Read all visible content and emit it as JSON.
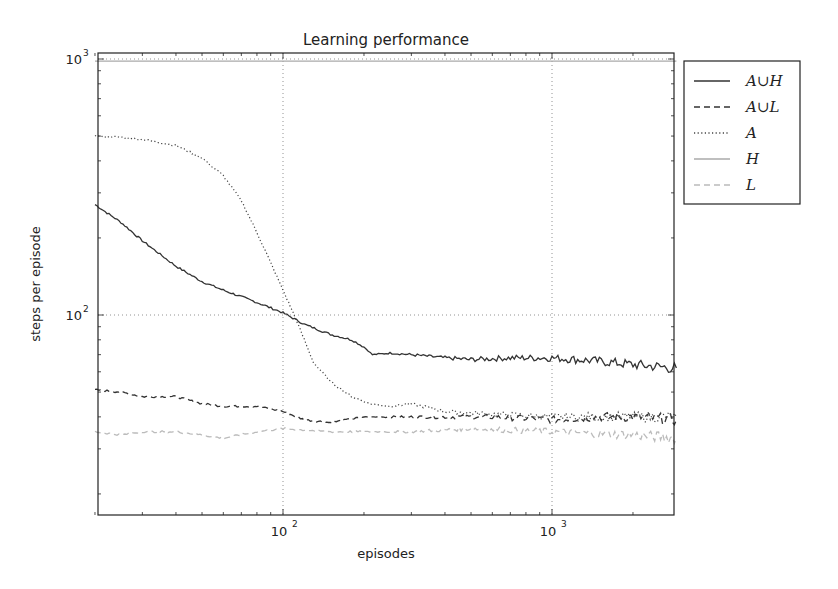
{
  "chart_data": {
    "type": "line",
    "title": "Learning performance",
    "xlabel": "episodes",
    "ylabel": "steps per episode",
    "xscale": "log",
    "yscale": "log",
    "xlim": [
      20,
      2900
    ],
    "ylim": [
      16.5,
      1050
    ],
    "x_ticks": [
      {
        "value": 100,
        "label": "10",
        "exp": "2"
      },
      {
        "value": 1000,
        "label": "10",
        "exp": "3"
      }
    ],
    "y_ticks": [
      {
        "value": 100,
        "label": "10",
        "exp": "2"
      },
      {
        "value": 1000,
        "label": "10",
        "exp": "3"
      }
    ],
    "grid": true,
    "legend_position": "outside upper right",
    "series": [
      {
        "name": "A∪H",
        "style": "solid",
        "color": "#333333",
        "x": [
          20,
          25,
          30,
          40,
          50,
          60,
          80,
          100,
          120,
          150,
          180,
          200,
          215,
          250,
          300,
          400,
          500,
          700,
          1000,
          1500,
          2000,
          2900
        ],
        "y": [
          270,
          230,
          195,
          155,
          135,
          125,
          112,
          102,
          92,
          84,
          80,
          75,
          70,
          71,
          70,
          68,
          67,
          68,
          68,
          66,
          64,
          62
        ]
      },
      {
        "name": "A∪L",
        "style": "dashed",
        "color": "#333333",
        "x": [
          20,
          25,
          30,
          40,
          50,
          60,
          80,
          100,
          120,
          150,
          200,
          300,
          400,
          600,
          1000,
          1500,
          2000,
          2900
        ],
        "y": [
          51,
          50,
          48,
          48,
          45,
          44,
          44,
          42,
          39,
          38,
          40,
          40,
          40,
          40,
          39,
          40,
          40,
          39
        ]
      },
      {
        "name": "A",
        "style": "dotted",
        "color": "#444444",
        "x": [
          20,
          25,
          30,
          40,
          50,
          60,
          70,
          80,
          90,
          100,
          110,
          120,
          130,
          150,
          180,
          210,
          250,
          300,
          400,
          600,
          1000,
          2900
        ],
        "y": [
          500,
          495,
          485,
          460,
          410,
          350,
          280,
          210,
          160,
          125,
          100,
          80,
          65,
          55,
          48,
          45,
          44,
          45,
          42,
          41,
          40,
          40
        ]
      },
      {
        "name": "H",
        "style": "solid",
        "color": "#aaaaaa",
        "x": [
          20,
          100,
          1000,
          2900
        ],
        "y": [
          980,
          980,
          980,
          980
        ]
      },
      {
        "name": "L",
        "style": "dashed",
        "color": "#bbbbbb",
        "x": [
          20,
          25,
          30,
          40,
          50,
          60,
          80,
          100,
          150,
          200,
          300,
          500,
          1000,
          2000,
          2900
        ],
        "y": [
          35,
          34,
          35,
          35,
          34,
          33,
          35,
          36,
          35,
          35,
          35,
          36,
          35,
          34,
          33
        ]
      }
    ]
  },
  "legend": {
    "items": [
      {
        "label": "A∪H"
      },
      {
        "label": "A∪L"
      },
      {
        "label": "A"
      },
      {
        "label": "H"
      },
      {
        "label": "L"
      }
    ]
  }
}
